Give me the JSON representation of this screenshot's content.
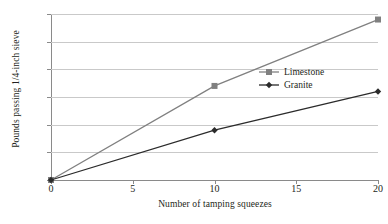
{
  "chart_data": {
    "type": "line",
    "title": "",
    "xlabel": "Number of tamping squeezes",
    "ylabel": "Pounds passing 1/4-inch sieve",
    "x": [
      0,
      10,
      20
    ],
    "xlim": [
      0,
      20
    ],
    "ylim": [
      0,
      30
    ],
    "xticks": [
      "0",
      "5",
      "10",
      "15",
      "20"
    ],
    "yticks": [
      "0",
      "5",
      "10",
      "15",
      "20",
      "25",
      "30"
    ],
    "grid": "horizontal",
    "legend_position": "center-right",
    "series": [
      {
        "name": "Limestone",
        "values": [
          0,
          17,
          29
        ],
        "color": "#808080",
        "marker": "square"
      },
      {
        "name": "Granite",
        "values": [
          0,
          9,
          16
        ],
        "color": "#2b2b2b",
        "marker": "diamond"
      }
    ]
  },
  "colors": {
    "background": "#ffffff",
    "axis": "#8a8a8a",
    "gridline": "#c9c9c9",
    "text": "#231f20",
    "limestone": "#808080",
    "granite": "#2b2b2b"
  }
}
